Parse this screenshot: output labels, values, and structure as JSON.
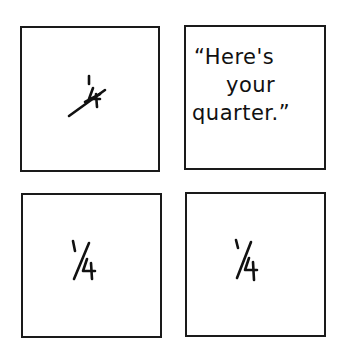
{
  "comic": {
    "panels": [
      {
        "text": "1/4",
        "style": "diagonal-fraction"
      },
      {
        "text": "“Here's your quarter.”",
        "lines": [
          "“Here's",
          "your",
          "quarter.”"
        ]
      },
      {
        "text": "1/4",
        "style": "slanted-fraction"
      },
      {
        "text": "1/4",
        "style": "slanted-fraction"
      }
    ]
  }
}
